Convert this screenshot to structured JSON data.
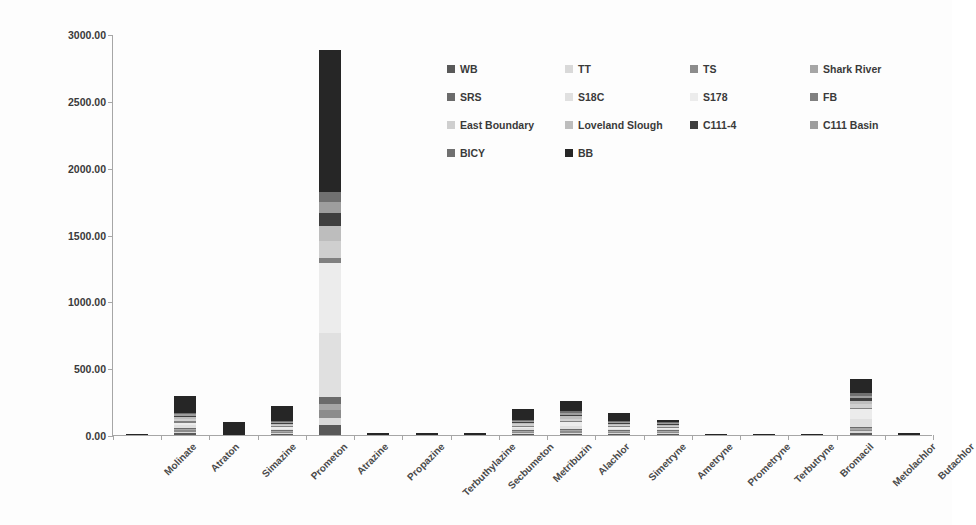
{
  "chart_data": {
    "type": "bar",
    "subtype": "stacked-column",
    "title": "",
    "xlabel": "",
    "ylabel": "Sum of Concentrations (ng/L)",
    "ylim": [
      0,
      3000
    ],
    "ytick_step": 500,
    "ytick_labels": [
      "0.00",
      "500.00",
      "1000.00",
      "1500.00",
      "2000.00",
      "2500.00",
      "3000.00"
    ],
    "ytick_values": [
      0,
      500,
      1000,
      1500,
      2000,
      2500,
      3000
    ],
    "grid": false,
    "legend_position": "top-right",
    "legend_columns": 4,
    "categories": [
      "Molinate",
      "Atraton",
      "Simazine",
      "Prometon",
      "Atrazine",
      "Propazine",
      "Terbuthylazine",
      "Secbumeton",
      "Metribuzin",
      "Alachlor",
      "Simetryne",
      "Ametryne",
      "Prometryne",
      "Terbutryne",
      "Bromacil",
      "Metolachlor",
      "Butachlor"
    ],
    "series": [
      {
        "name": "WB",
        "color": "#595959",
        "values": [
          0,
          12,
          0,
          8,
          75,
          0,
          0,
          0,
          6,
          10,
          7,
          3,
          0,
          0,
          0,
          15,
          0
        ]
      },
      {
        "name": "TT",
        "color": "#d9d9d9",
        "values": [
          0,
          10,
          0,
          5,
          55,
          0,
          0,
          0,
          4,
          8,
          5,
          2,
          0,
          0,
          0,
          12,
          0
        ]
      },
      {
        "name": "TS",
        "color": "#8c8c8c",
        "values": [
          0,
          14,
          0,
          6,
          60,
          0,
          0,
          0,
          5,
          9,
          6,
          2,
          0,
          0,
          0,
          14,
          0
        ]
      },
      {
        "name": "Shark River",
        "color": "#a6a6a6",
        "values": [
          0,
          8,
          0,
          4,
          45,
          0,
          0,
          0,
          3,
          7,
          4,
          2,
          0,
          0,
          0,
          10,
          0
        ]
      },
      {
        "name": "SRS",
        "color": "#6b6b6b",
        "values": [
          0,
          10,
          0,
          5,
          50,
          0,
          0,
          0,
          4,
          8,
          5,
          2,
          0,
          0,
          0,
          11,
          0
        ]
      },
      {
        "name": "S18C",
        "color": "#e0e0e0",
        "values": [
          0,
          18,
          0,
          10,
          480,
          0,
          0,
          0,
          12,
          26,
          9,
          4,
          0,
          0,
          0,
          60,
          0
        ]
      },
      {
        "name": "S178",
        "color": "#ececec",
        "values": [
          0,
          22,
          0,
          12,
          520,
          0,
          0,
          0,
          14,
          30,
          10,
          5,
          0,
          0,
          0,
          70,
          0
        ]
      },
      {
        "name": "FB",
        "color": "#808080",
        "values": [
          0,
          9,
          0,
          5,
          40,
          0,
          0,
          0,
          4,
          7,
          5,
          2,
          0,
          0,
          0,
          10,
          0
        ]
      },
      {
        "name": "East Boundary",
        "color": "#cfcfcf",
        "values": [
          0,
          16,
          0,
          8,
          130,
          0,
          0,
          0,
          8,
          18,
          7,
          3,
          0,
          0,
          0,
          30,
          0
        ]
      },
      {
        "name": "Loveland Slough",
        "color": "#bdbdbd",
        "values": [
          0,
          14,
          0,
          7,
          110,
          0,
          0,
          0,
          7,
          16,
          6,
          3,
          0,
          0,
          0,
          26,
          0
        ]
      },
      {
        "name": "C111-4",
        "color": "#3f3f3f",
        "values": [
          0,
          12,
          0,
          6,
          95,
          0,
          0,
          0,
          6,
          14,
          6,
          3,
          0,
          0,
          0,
          20,
          0
        ]
      },
      {
        "name": "C111 Basin",
        "color": "#9e9e9e",
        "values": [
          0,
          11,
          0,
          6,
          85,
          0,
          0,
          0,
          6,
          13,
          5,
          3,
          0,
          0,
          0,
          18,
          0
        ]
      },
      {
        "name": "BICY",
        "color": "#707070",
        "values": [
          0,
          10,
          0,
          5,
          70,
          0,
          0,
          0,
          5,
          11,
          5,
          2,
          0,
          0,
          0,
          16,
          0
        ]
      },
      {
        "name": "BB",
        "color": "#262626",
        "values": [
          4,
          130,
          97,
          110,
          1065,
          14,
          13,
          13,
          85,
          80,
          63,
          15,
          9,
          10,
          2,
          105,
          14
        ]
      }
    ],
    "category_totals": [
      4,
      296,
      97,
      197,
      2880,
      14,
      13,
      13,
      169,
      257,
      143,
      51,
      9,
      10,
      2,
      417,
      14
    ],
    "annotations": []
  },
  "axis": {
    "y_title": "Sum of Concentrations (ng/L)"
  },
  "legend": {
    "entries": [
      {
        "label": "WB",
        "color": "#595959"
      },
      {
        "label": "TT",
        "color": "#d9d9d9"
      },
      {
        "label": "TS",
        "color": "#8c8c8c"
      },
      {
        "label": "Shark River",
        "color": "#a6a6a6"
      },
      {
        "label": "SRS",
        "color": "#6b6b6b"
      },
      {
        "label": "S18C",
        "color": "#e0e0e0"
      },
      {
        "label": "S178",
        "color": "#ececec"
      },
      {
        "label": "FB",
        "color": "#808080"
      },
      {
        "label": "East Boundary",
        "color": "#cfcfcf"
      },
      {
        "label": "Loveland Slough",
        "color": "#bdbdbd"
      },
      {
        "label": "C111-4",
        "color": "#3f3f3f"
      },
      {
        "label": "C111 Basin",
        "color": "#9e9e9e"
      },
      {
        "label": "BICY",
        "color": "#707070"
      },
      {
        "label": "BB",
        "color": "#262626"
      }
    ]
  },
  "colors": {
    "axis_line": "#a6a6a6",
    "text": "#3a3a3a",
    "background": "#ffffff"
  }
}
